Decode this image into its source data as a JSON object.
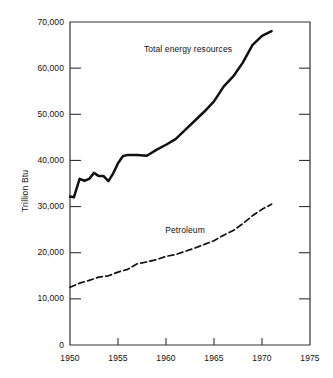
{
  "chart_data": {
    "type": "line",
    "title": "",
    "xlabel": "",
    "ylabel": "Trillion Btu",
    "xlim": [
      1950,
      1975
    ],
    "ylim": [
      0,
      70000
    ],
    "grid": false,
    "legend_position": "inline-annotations",
    "x_ticks": [
      "1950",
      "1955",
      "1960",
      "1965",
      "1970",
      "1975"
    ],
    "x_tick_values": [
      1950,
      1955,
      1960,
      1965,
      1970,
      1975
    ],
    "y_ticks": [
      "0",
      "10,000",
      "20,000",
      "30,000",
      "40,000",
      "50,000",
      "60,000",
      "70,000"
    ],
    "y_tick_values": [
      0,
      10000,
      20000,
      30000,
      40000,
      50000,
      60000,
      70000
    ],
    "series": [
      {
        "name": "Total energy resources",
        "style": "solid",
        "color": "#111111",
        "x": [
          1950,
          1950.4,
          1951,
          1951.5,
          1952,
          1952.5,
          1953,
          1953.5,
          1954,
          1954.5,
          1955,
          1955.5,
          1956,
          1957,
          1958,
          1959,
          1960,
          1961,
          1962,
          1963,
          1964,
          1965,
          1966,
          1967,
          1968,
          1969,
          1970,
          1971
        ],
        "values": [
          32200,
          32000,
          36000,
          35600,
          36000,
          37300,
          36600,
          36600,
          35500,
          37200,
          39400,
          40900,
          41200,
          41200,
          41000,
          42300,
          43400,
          44600,
          46600,
          48600,
          50600,
          52800,
          56000,
          58200,
          61200,
          65000,
          67000,
          68000
        ]
      },
      {
        "name": "Petroleum",
        "style": "dashed",
        "color": "#111111",
        "x": [
          1950,
          1951,
          1952,
          1953,
          1954,
          1955,
          1956,
          1957,
          1958,
          1959,
          1960,
          1961,
          1962,
          1963,
          1964,
          1965,
          1966,
          1967,
          1968,
          1969,
          1970,
          1971
        ],
        "values": [
          12500,
          13400,
          14000,
          14700,
          15000,
          15800,
          16400,
          17600,
          18000,
          18500,
          19200,
          19600,
          20300,
          21000,
          21800,
          22600,
          23800,
          24800,
          26300,
          28000,
          29400,
          30500
        ]
      }
    ],
    "annotations": [
      {
        "text": "Total energy resources",
        "x_px": 188,
        "y_px": 50
      },
      {
        "text": "Petroleum",
        "x_px": 185,
        "y_px": 231
      }
    ],
    "axis_colors": {
      "frame": "#333333",
      "text": "#111111",
      "background": "#ffffff"
    }
  }
}
